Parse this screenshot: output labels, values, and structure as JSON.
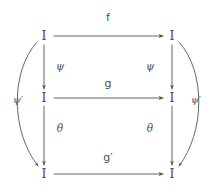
{
  "diagram": {
    "kind": "commutative-diagram",
    "stroke_color": "#555555",
    "text_color": "#4a4a4a",
    "background_color": "#ffffff",
    "nodes": [
      {
        "id": "top-left",
        "label": "I",
        "x": 44,
        "y": 36
      },
      {
        "id": "top-right",
        "label": "I",
        "x": 172,
        "y": 36
      },
      {
        "id": "mid-left",
        "label": "I",
        "x": 44,
        "y": 98
      },
      {
        "id": "mid-right",
        "label": "I",
        "x": 172,
        "y": 98
      },
      {
        "id": "bottom-left",
        "label": "I",
        "x": 44,
        "y": 174
      },
      {
        "id": "bottom-right",
        "label": "I",
        "x": 172,
        "y": 174
      }
    ],
    "labels": {
      "top_horizontal": "f",
      "middle_horizontal": "g",
      "bottom_horizontal": "g′",
      "left_vertical_upper": "ψ",
      "right_vertical_upper": "ψ",
      "left_vertical_lower": "θ",
      "right_vertical_lower": "θ",
      "left_arc": "ψ′",
      "right_arc": "ψ′"
    },
    "label_positions": {
      "top_horizontal": {
        "x": 108,
        "y": 17
      },
      "middle_horizontal": {
        "x": 108,
        "y": 83
      },
      "bottom_horizontal": {
        "x": 108,
        "y": 157
      },
      "left_vertical_upper": {
        "x": 60,
        "y": 66
      },
      "right_vertical_upper": {
        "x": 150,
        "y": 66
      },
      "left_vertical_lower": {
        "x": 60,
        "y": 128
      },
      "right_vertical_lower": {
        "x": 150,
        "y": 128
      },
      "left_arc": {
        "x": 18,
        "y": 100
      },
      "right_arc": {
        "x": 196,
        "y": 100
      }
    },
    "edges": [
      {
        "id": "f",
        "from": "top-left",
        "to": "top-right",
        "shape": "straight",
        "direction": "right"
      },
      {
        "id": "g",
        "from": "mid-left",
        "to": "mid-right",
        "shape": "straight",
        "direction": "right"
      },
      {
        "id": "g-prime",
        "from": "bottom-left",
        "to": "bottom-right",
        "shape": "straight",
        "direction": "right"
      },
      {
        "id": "psi-left",
        "from": "top-left",
        "to": "mid-left",
        "shape": "straight",
        "direction": "down"
      },
      {
        "id": "psi-right",
        "from": "top-right",
        "to": "mid-right",
        "shape": "straight",
        "direction": "down"
      },
      {
        "id": "theta-left",
        "from": "mid-left",
        "to": "bottom-left",
        "shape": "straight",
        "direction": "down"
      },
      {
        "id": "theta-right",
        "from": "mid-right",
        "to": "bottom-right",
        "shape": "straight",
        "direction": "down"
      },
      {
        "id": "psi-prime-left",
        "from": "top-left",
        "to": "bottom-left",
        "shape": "arc-left",
        "direction": "down"
      },
      {
        "id": "psi-prime-right",
        "from": "top-right",
        "to": "bottom-right",
        "shape": "arc-right",
        "direction": "down"
      }
    ]
  }
}
